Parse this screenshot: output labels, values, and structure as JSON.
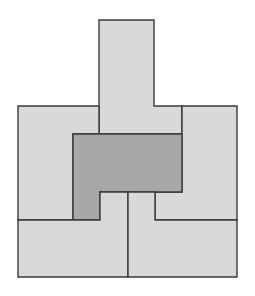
{
  "diagram": {
    "type": "tiling-puzzle",
    "colors": {
      "background": "#ffffff",
      "light_piece": "#d9d9d9",
      "dark_piece": "#a8a8a8",
      "outline": "#3a3a3a"
    },
    "pieces": [
      {
        "id": "top-tall",
        "shade": "light",
        "points": "99,20 154,20 154,106 182,106 182,134 99,134"
      },
      {
        "id": "left-L",
        "shade": "light",
        "points": "18,106 99,106 99,134 73,134 73,220 18,220"
      },
      {
        "id": "right-L",
        "shade": "light",
        "points": "182,106 237,106 237,220 155,220 155,192 182,192"
      },
      {
        "id": "center-dark",
        "shade": "dark",
        "points": "73,134 182,134 182,192 100,192 100,220 73,220"
      },
      {
        "id": "bottom-left",
        "shade": "light",
        "points": "18,220 100,220 100,192 128,192 128,277 18,277"
      },
      {
        "id": "bottom-right",
        "shade": "light",
        "points": "128,192 155,192 155,220 237,220 237,277 128,277"
      }
    ]
  }
}
